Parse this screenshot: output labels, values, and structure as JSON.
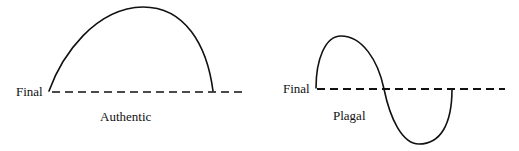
{
  "diagram": {
    "panels": [
      {
        "name": "authentic",
        "final_label": "Final",
        "caption": "Authentic",
        "shape": "single arch rising from the final and returning to it"
      },
      {
        "name": "plagal",
        "final_label": "Final",
        "caption": "Plagal",
        "shape": "S-curve rising above then dipping below the final"
      }
    ],
    "colors": {
      "ink": "#111111",
      "background": "#ffffff"
    }
  }
}
